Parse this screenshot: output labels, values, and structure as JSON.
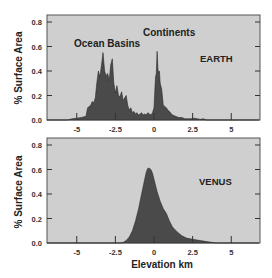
{
  "chart_data": [
    {
      "type": "area",
      "title": "EARTH",
      "xlabel": "",
      "ylabel": "% Surface Area",
      "xlim": [
        -7,
        6.8
      ],
      "ylim": [
        0,
        0.85
      ],
      "x_ticks": [
        -5,
        -2.5,
        0,
        2.5,
        5
      ],
      "x_tick_labels": [
        "-5",
        "-2.5",
        "0",
        "2.5",
        "5"
      ],
      "y_ticks": [
        0.0,
        0.2,
        0.4,
        0.6,
        0.8
      ],
      "y_tick_labels": [
        "0.0",
        "0.2",
        "0.4",
        "0.6",
        "0.8"
      ],
      "grid": false,
      "annotations": [
        {
          "text": "Ocean Basins",
          "x": -3.3,
          "y": 0.6
        },
        {
          "text": "Continents",
          "x": 0.3,
          "y": 0.7
        },
        {
          "text": "EARTH",
          "x": 3.3,
          "y": 0.48
        }
      ],
      "series": [
        {
          "name": "Earth hypsometry",
          "x": [
            -7.0,
            -5.6,
            -5.3,
            -5.0,
            -4.7,
            -4.4,
            -4.3,
            -4.1,
            -4.0,
            -3.9,
            -3.8,
            -3.7,
            -3.6,
            -3.5,
            -3.4,
            -3.3,
            -3.2,
            -3.1,
            -3.0,
            -2.9,
            -2.8,
            -2.7,
            -2.6,
            -2.5,
            -2.4,
            -2.3,
            -2.2,
            -2.1,
            -2.0,
            -1.9,
            -1.8,
            -1.7,
            -1.6,
            -1.5,
            -1.4,
            -1.3,
            -1.2,
            -1.1,
            -1.0,
            -0.9,
            -0.8,
            -0.7,
            -0.6,
            -0.5,
            -0.4,
            -0.3,
            -0.2,
            -0.1,
            0.0,
            0.1,
            0.15,
            0.2,
            0.25,
            0.3,
            0.35,
            0.4,
            0.5,
            0.6,
            0.7,
            0.8,
            0.9,
            1.0,
            1.2,
            1.4,
            1.6,
            1.8,
            2.0,
            2.2,
            2.4,
            2.6,
            2.8,
            3.0,
            3.2,
            3.4,
            6.8
          ],
          "values": [
            0.0,
            0.0,
            0.01,
            0.015,
            0.02,
            0.03,
            0.1,
            0.12,
            0.15,
            0.14,
            0.18,
            0.3,
            0.4,
            0.35,
            0.45,
            0.55,
            0.4,
            0.36,
            0.38,
            0.32,
            0.45,
            0.5,
            0.3,
            0.22,
            0.28,
            0.2,
            0.19,
            0.23,
            0.16,
            0.18,
            0.2,
            0.12,
            0.08,
            0.1,
            0.06,
            0.07,
            0.05,
            0.06,
            0.04,
            0.05,
            0.06,
            0.04,
            0.05,
            0.04,
            0.06,
            0.05,
            0.04,
            0.06,
            0.1,
            0.35,
            0.38,
            0.56,
            0.42,
            0.38,
            0.4,
            0.3,
            0.25,
            0.12,
            0.11,
            0.1,
            0.08,
            0.07,
            0.04,
            0.03,
            0.02,
            0.02,
            0.01,
            0.01,
            0.01,
            0.015,
            0.01,
            0.005,
            0.01,
            0.0,
            0.0
          ]
        }
      ]
    },
    {
      "type": "area",
      "title": "VENUS",
      "xlabel": "Elevation km",
      "ylabel": "% Surface Area",
      "xlim": [
        -7,
        6.8
      ],
      "ylim": [
        0,
        0.85
      ],
      "x_ticks": [
        -5,
        -2.5,
        0,
        2.5,
        5
      ],
      "x_tick_labels": [
        "-5",
        "-2.5",
        "0",
        "2.5",
        "5"
      ],
      "y_ticks": [
        0.0,
        0.2,
        0.4,
        0.6,
        0.8
      ],
      "y_tick_labels": [
        "0.0",
        "0.2",
        "0.4",
        "0.6",
        "0.8"
      ],
      "grid": false,
      "annotations": [
        {
          "text": "VENUS",
          "x": 3.2,
          "y": 0.46
        }
      ],
      "series": [
        {
          "name": "Venus hypsometry",
          "x": [
            -7.0,
            -2.2,
            -2.0,
            -1.8,
            -1.6,
            -1.4,
            -1.2,
            -1.0,
            -0.8,
            -0.6,
            -0.5,
            -0.4,
            -0.3,
            -0.2,
            -0.1,
            0.0,
            0.2,
            0.4,
            0.6,
            0.8,
            1.0,
            1.2,
            1.5,
            1.8,
            2.1,
            2.5,
            3.0,
            3.5,
            4.0,
            6.8
          ],
          "values": [
            0.0,
            0.0,
            0.005,
            0.02,
            0.05,
            0.1,
            0.18,
            0.28,
            0.4,
            0.52,
            0.58,
            0.61,
            0.61,
            0.6,
            0.57,
            0.52,
            0.42,
            0.34,
            0.28,
            0.24,
            0.18,
            0.13,
            0.09,
            0.06,
            0.04,
            0.03,
            0.02,
            0.01,
            0.0,
            0.0
          ]
        }
      ]
    }
  ],
  "figure": {
    "ylabel_top": "% Surface Area",
    "ylabel_bottom": "% Surface Area",
    "xlabel": "Elevation km"
  },
  "colors": {
    "plot_background": "#cfcfcf",
    "area_fill": "#4a4a4a",
    "area_stroke": "#2a2a2a",
    "frame": "#555555"
  }
}
